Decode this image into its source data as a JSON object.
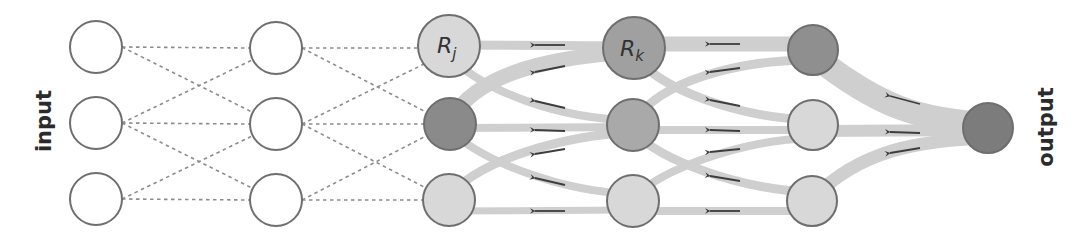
{
  "labels": {
    "input": "input",
    "output": "output",
    "rj_main": "R",
    "rj_sub": "j",
    "rk_main": "R",
    "rk_sub": "k"
  },
  "colors": {
    "background": "#ffffff",
    "node_stroke": "#6e6e6e",
    "forward_edge": "#8c8c8c",
    "relevance_edge": "#cfcfcf",
    "arrow": "#3d3d3d",
    "node_empty": "#ffffff",
    "node_light": "#d8d8d8",
    "node_mid": "#a9a9a9",
    "node_dark": "#8a8a8a",
    "node_darkest": "#7c7c7c"
  },
  "layers": [
    {
      "name": "input",
      "x": 96,
      "nodes": [
        {
          "y": 47,
          "r": 26,
          "fill": "empty"
        },
        {
          "y": 123,
          "r": 26,
          "fill": "empty"
        },
        {
          "y": 199,
          "r": 26,
          "fill": "empty"
        }
      ]
    },
    {
      "name": "hidden-1",
      "x": 276,
      "nodes": [
        {
          "y": 48,
          "r": 26,
          "fill": "empty"
        },
        {
          "y": 124,
          "r": 26,
          "fill": "empty"
        },
        {
          "y": 200,
          "r": 26,
          "fill": "empty"
        }
      ]
    },
    {
      "name": "hidden-2",
      "x": 449,
      "nodes": [
        {
          "y": 46,
          "r": 31,
          "fill": "light",
          "label": "Rj"
        },
        {
          "y": 124,
          "r": 26,
          "fill": "dark"
        },
        {
          "y": 200,
          "r": 26,
          "fill": "light"
        }
      ]
    },
    {
      "name": "hidden-3",
      "x": 634,
      "nodes": [
        {
          "y": 48,
          "r": 31,
          "fill": "dark",
          "label": "Rk"
        },
        {
          "y": 125,
          "r": 26,
          "fill": "mid"
        },
        {
          "y": 201,
          "r": 26,
          "fill": "light"
        }
      ]
    },
    {
      "name": "hidden-4",
      "x": 813,
      "nodes": [
        {
          "y": 50,
          "r": 25,
          "fill": "dark"
        },
        {
          "y": 125,
          "r": 25,
          "fill": "light"
        },
        {
          "y": 201,
          "r": 25,
          "fill": "light"
        }
      ]
    },
    {
      "name": "output",
      "x": 988,
      "nodes": [
        {
          "y": 128,
          "r": 25,
          "fill": "darkest"
        }
      ]
    }
  ],
  "forward_connections": "dashed, each node connects to same row and adjacent rows (input→hidden-1, hidden-1→hidden-2)",
  "relevance_flows": [
    {
      "from": "output",
      "to": "hidden-4 top",
      "width": 24
    },
    {
      "from": "output",
      "to": "hidden-4 mid",
      "width": 12
    },
    {
      "from": "output",
      "to": "hidden-4 bottom",
      "width": 13
    },
    {
      "from": "hidden-4 top",
      "to": "hidden-3 top",
      "width": 15
    },
    {
      "from": "hidden-4 top",
      "to": "hidden-3 mid",
      "width": 9
    },
    {
      "from": "hidden-4 mid",
      "to": "hidden-3 top",
      "width": 9
    },
    {
      "from": "hidden-4 mid",
      "to": "hidden-3 mid",
      "width": 8
    },
    {
      "from": "hidden-4 mid",
      "to": "hidden-3 bottom",
      "width": 8
    },
    {
      "from": "hidden-4 bottom",
      "to": "hidden-3 mid",
      "width": 9
    },
    {
      "from": "hidden-4 bottom",
      "to": "hidden-3 bottom",
      "width": 8
    },
    {
      "from": "hidden-3 top",
      "to": "hidden-2 top",
      "width": 8
    },
    {
      "from": "hidden-3 top",
      "to": "hidden-2 mid",
      "width": 15
    },
    {
      "from": "hidden-3 mid",
      "to": "hidden-2 top",
      "width": 8
    },
    {
      "from": "hidden-3 mid",
      "to": "hidden-2 mid",
      "width": 8
    },
    {
      "from": "hidden-3 mid",
      "to": "hidden-2 bottom",
      "width": 9
    },
    {
      "from": "hidden-3 bottom",
      "to": "hidden-2 mid",
      "width": 8
    },
    {
      "from": "hidden-3 bottom",
      "to": "hidden-2 bottom",
      "width": 7
    }
  ]
}
